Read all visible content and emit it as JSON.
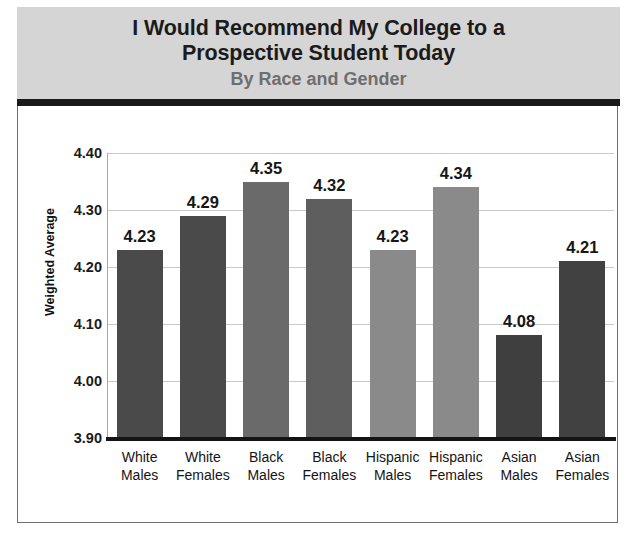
{
  "header": {
    "title_line1": "I Would Recommend My College to a",
    "title_line2": "Prospective Student Today",
    "subtitle": "By Race and Gender"
  },
  "colors": {
    "header_background": "#d5d5d5",
    "header_rule": "#1a1a1a",
    "title_text": "#1b1b1b",
    "subtitle_text": "#6e6e6e",
    "bar_dark": "#4a4a4a",
    "bar_light": "#808080",
    "gridline": "#c9c9c9",
    "axis_line": "#141414"
  },
  "chart_data": {
    "type": "bar",
    "title": "I Would Recommend My College to a Prospective Student Today",
    "subtitle": "By Race and Gender",
    "xlabel": "",
    "ylabel": "Weighted Average",
    "ylim": [
      3.9,
      4.4
    ],
    "ytick_values": [
      4.4,
      4.3,
      4.2,
      4.1,
      4.0,
      3.9
    ],
    "ytick_labels": [
      "4.40",
      "4.30",
      "4.20",
      "4.10",
      "4.00",
      "3.90"
    ],
    "grid": true,
    "legend": false,
    "value_labels_shown": true,
    "categories": [
      "White Males",
      "White Females",
      "Black Males",
      "Black Females",
      "Hispanic Males",
      "Hispanic Females",
      "Asian Males",
      "Asian Females"
    ],
    "category_lines": [
      [
        "White",
        "Males"
      ],
      [
        "White",
        "Females"
      ],
      [
        "Black",
        "Males"
      ],
      [
        "Black",
        "Females"
      ],
      [
        "Hispanic",
        "Males"
      ],
      [
        "Hispanic",
        "Females"
      ],
      [
        "Asian",
        "Males"
      ],
      [
        "Asian",
        "Females"
      ]
    ],
    "values": [
      4.23,
      4.29,
      4.35,
      4.32,
      4.23,
      4.34,
      4.08,
      4.21
    ],
    "value_labels": [
      "4.23",
      "4.29",
      "4.35",
      "4.32",
      "4.23",
      "4.34",
      "4.08",
      "4.21"
    ],
    "bar_colors": [
      "#4a4a4a",
      "#4a4a4a",
      "#6a6a6a",
      "#5e5e5e",
      "#8a8a8a",
      "#8a8a8a",
      "#3f3f3f",
      "#414141"
    ]
  }
}
